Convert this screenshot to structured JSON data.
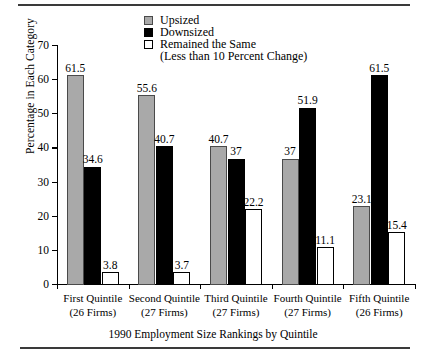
{
  "chart_data": {
    "type": "bar",
    "title": "",
    "xlabel": "1990 Employment Size Rankings by Quintile",
    "ylabel": "Percentage in Each Category",
    "ylim": [
      0,
      70
    ],
    "yticks": [
      0,
      10,
      20,
      30,
      40,
      50,
      60,
      70
    ],
    "grid": false,
    "legend_position": "top-center",
    "categories": [
      "First Quintile",
      "Second Quintile",
      "Third Quintile",
      "Fourth Quintile",
      "Fifth Quintile"
    ],
    "category_sublabels": [
      "(26 Firms)",
      "(27 Firms)",
      "(27 Firms)",
      "(27 Firms)",
      "(26 Firms)"
    ],
    "series": [
      {
        "name": "Upsized",
        "color": "#a9a9a9",
        "values": [
          61.5,
          55.6,
          40.7,
          37,
          23.1
        ],
        "labels": [
          "61.5",
          "55.6",
          "40.7",
          "37",
          "23.1"
        ]
      },
      {
        "name": "Downsized",
        "color": "#000000",
        "values": [
          34.6,
          40.7,
          37,
          51.9,
          61.5
        ],
        "labels": [
          "34.6",
          "40.7",
          "37",
          "51.9",
          "61.5"
        ]
      },
      {
        "name": "Remained the Same",
        "color": "#ffffff",
        "values": [
          3.8,
          3.7,
          22.2,
          11.1,
          15.4
        ],
        "labels": [
          "3.8",
          "3.7",
          "22.2",
          "11.1",
          "15.4"
        ]
      }
    ],
    "legend": [
      {
        "label": "Upsized",
        "swatch": "gray"
      },
      {
        "label": "Downsized",
        "swatch": "black"
      },
      {
        "label": "Remained the Same",
        "swatch": "white"
      }
    ],
    "legend_note": "(Less than 10 Percent Change)"
  }
}
